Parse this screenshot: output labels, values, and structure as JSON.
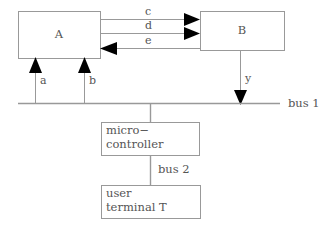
{
  "diagram": {
    "type": "block-diagram",
    "colors": {
      "line": "#999999",
      "arrowhead": "#000000",
      "text": "#555555",
      "background": "#ffffff"
    },
    "blocks": [
      {
        "id": "A",
        "label": "A",
        "x": 18,
        "y": 11,
        "w": 82,
        "h": 47,
        "align": "center"
      },
      {
        "id": "B",
        "label": "B",
        "x": 200,
        "y": 11,
        "w": 84,
        "h": 39,
        "align": "center"
      },
      {
        "id": "mcu",
        "label_line1": "micro−",
        "label_line2": "controller",
        "x": 101,
        "y": 122,
        "w": 98,
        "h": 33,
        "align": "left"
      },
      {
        "id": "terminal",
        "label_line1": "user",
        "label_line2": "terminal T",
        "x": 101,
        "y": 185,
        "w": 99,
        "h": 33,
        "align": "left"
      }
    ],
    "signals": [
      {
        "name": "c",
        "from": "A",
        "to": "B",
        "direction": "right",
        "y": 19
      },
      {
        "name": "d",
        "from": "A",
        "to": "B",
        "direction": "right",
        "y": 33
      },
      {
        "name": "e",
        "from": "B",
        "to": "A",
        "direction": "left",
        "y": 48
      },
      {
        "name": "a",
        "from": "bus 1",
        "to": "A",
        "direction": "up",
        "x": 35
      },
      {
        "name": "b",
        "from": "bus 1",
        "to": "A",
        "direction": "up",
        "x": 84
      },
      {
        "name": "y",
        "from": "B",
        "to": "bus 1",
        "direction": "down",
        "x": 240
      }
    ],
    "buses": [
      {
        "name": "bus 1",
        "label": "bus 1",
        "orientation": "horizontal",
        "y": 103,
        "x1": 18,
        "x2": 280,
        "label_x": 288,
        "label_y": 97
      },
      {
        "name": "bus 2",
        "label": "bus 2",
        "orientation": "vertical",
        "x": 150,
        "y1": 155,
        "y2": 185,
        "label_x": 158,
        "label_y": 163
      }
    ]
  }
}
